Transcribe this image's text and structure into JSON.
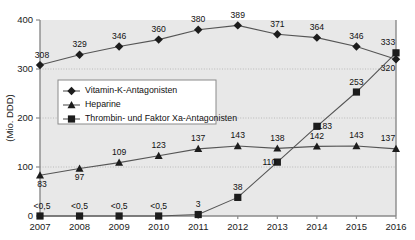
{
  "chart_data": {
    "type": "line",
    "title": "",
    "xlabel": "",
    "ylabel": "(Mio. DDD)",
    "ylim": [
      0,
      400
    ],
    "yticks": [
      0,
      100,
      200,
      300,
      400
    ],
    "ytick_labels": [
      "0",
      "100",
      "200",
      "300",
      "400"
    ],
    "grid": true,
    "grid_axis": "y",
    "legend_position": "upper-left-inside",
    "categories": [
      2007,
      2008,
      2009,
      2010,
      2011,
      2012,
      2013,
      2014,
      2015,
      2016
    ],
    "xtick_labels": [
      "2007",
      "2008",
      "2009",
      "2010",
      "2011",
      "2012",
      "2013",
      "2014",
      "2015",
      "2016"
    ],
    "series": [
      {
        "name": "Vitamin-K-Antagonisten",
        "marker": "diamond",
        "color": "#1c1c1c",
        "values": [
          308,
          329,
          346,
          360,
          380,
          389,
          371,
          364,
          346,
          320
        ],
        "labels": [
          "308",
          "329",
          "346",
          "360",
          "380",
          "389",
          "371",
          "364",
          "346",
          "320"
        ],
        "label_positions": [
          "above",
          "above",
          "above",
          "above",
          "above",
          "above",
          "above",
          "above",
          "above",
          "below"
        ]
      },
      {
        "name": "Heparine",
        "marker": "triangle",
        "color": "#7a7a7a",
        "values": [
          83,
          97,
          109,
          123,
          137,
          143,
          138,
          142,
          143,
          137
        ],
        "labels": [
          "83",
          "97",
          "109",
          "123",
          "137",
          "143",
          "138",
          "142",
          "143",
          "137"
        ],
        "label_positions": [
          "below",
          "below",
          "above",
          "above",
          "above",
          "above",
          "above",
          "above",
          "above",
          "above"
        ]
      },
      {
        "name": "Thrombin- und Faktor Xa-Antagonisten",
        "marker": "square",
        "color": "#1c1c1c",
        "values": [
          0,
          0,
          0,
          0,
          3,
          38,
          110,
          183,
          253,
          333
        ],
        "labels": [
          "<0,5",
          "<0,5",
          "<0,5",
          "<0,5",
          "3",
          "38",
          "110",
          "183",
          "253",
          "333"
        ],
        "label_positions": [
          "above",
          "above",
          "above",
          "above",
          "above",
          "above",
          "left",
          "right",
          "above",
          "above"
        ]
      }
    ]
  },
  "legend": {
    "items": [
      {
        "label": "Vitamin-K-Antagonisten"
      },
      {
        "label": "Heparine"
      },
      {
        "label": "Thrombin- und Faktor Xa-Antagonisten"
      }
    ]
  }
}
